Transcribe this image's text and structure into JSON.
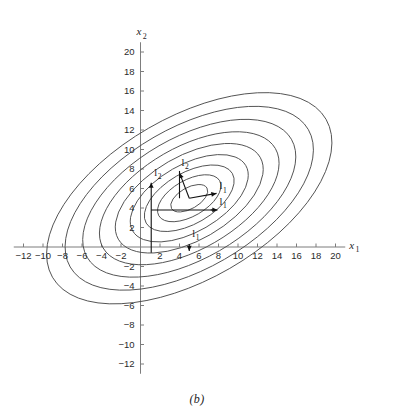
{
  "figure": {
    "caption": "(b)",
    "background_color": "#ffffff",
    "contour_color": "#4a4a4a",
    "axis_color": "#7d7d7d",
    "annotation_color": "#111111"
  },
  "axes": {
    "x": {
      "name": "x",
      "subscript": "1",
      "label": "x₁",
      "min": -13,
      "max": 21,
      "tick_step": 2,
      "ticks": [
        -12,
        -10,
        -8,
        -6,
        -4,
        -2,
        2,
        4,
        6,
        8,
        10,
        12,
        14,
        16,
        18,
        20
      ],
      "tick_labels": [
        "−12",
        "−10",
        "−8",
        "−6",
        "−4",
        "−2",
        "2",
        "4",
        "6",
        "8",
        "10",
        "12",
        "14",
        "16",
        "18",
        "20"
      ]
    },
    "y": {
      "name": "x",
      "subscript": "2",
      "label": "x₂",
      "min": -13,
      "max": 21,
      "tick_step": 2,
      "ticks": [
        -12,
        -10,
        -8,
        -6,
        -4,
        -2,
        2,
        4,
        6,
        8,
        10,
        12,
        14,
        16,
        18,
        20
      ],
      "tick_labels": [
        "−12",
        "−10",
        "−8",
        "−6",
        "−4",
        "−2",
        "2",
        "4",
        "6",
        "8",
        "10",
        "12",
        "14",
        "16",
        "18",
        "20"
      ]
    }
  },
  "annotations": {
    "vectors": [
      {
        "id": "l1-major",
        "label": "l",
        "subscript": "1",
        "display": "l₁",
        "description": "eigenvector along major axis",
        "from": [
          5.0,
          5.0
        ],
        "to": [
          7.8,
          5.5
        ],
        "label_at": [
          8.1,
          5.9
        ]
      },
      {
        "id": "l2-minor",
        "label": "l",
        "subscript": "2",
        "display": "l₂",
        "description": "eigenvector along minor axis",
        "from": [
          5.0,
          5.0
        ],
        "to": [
          4.0,
          7.6
        ],
        "label_at": [
          4.2,
          8.3
        ]
      },
      {
        "id": "l1-projection-x",
        "label": "l",
        "subscript": "1",
        "display": "l₁",
        "description": "projection of l1 onto x1 axis",
        "from": [
          5.0,
          0.3
        ],
        "to": [
          5.0,
          -0.4
        ],
        "label_at": [
          5.3,
          1.0
        ]
      },
      {
        "id": "l1-projection-y",
        "label": "l",
        "subscript": "1",
        "display": "l₁",
        "description": "horizontal component marker for l1",
        "from": [
          7.2,
          3.8
        ],
        "to": [
          7.9,
          3.8
        ],
        "label_at": [
          8.1,
          4.3
        ]
      },
      {
        "id": "l2-projection-y",
        "label": "l",
        "subscript": "2",
        "display": "l₂",
        "description": "projection of l2 onto x2 axis",
        "from": [
          1.1,
          4.0
        ],
        "to": [
          1.1,
          6.6
        ],
        "label_at": [
          1.4,
          7.3
        ]
      }
    ],
    "brackets": [
      {
        "id": "l1-horizontal-rule",
        "from": [
          1.1,
          3.8
        ],
        "to": [
          7.7,
          3.8
        ]
      },
      {
        "id": "l2-vertical-rule",
        "from": [
          1.1,
          -0.6
        ],
        "to": [
          1.1,
          4.0
        ]
      },
      {
        "id": "l2-top-rule",
        "from": [
          4.0,
          5.0
        ],
        "to": [
          4.0,
          7.8
        ]
      }
    ]
  },
  "chart_data": {
    "type": "line",
    "title": "",
    "subtitle": "",
    "xlabel": "x₁",
    "ylabel": "x₂",
    "xlim": [
      -13,
      21
    ],
    "ylim": [
      -13,
      21
    ],
    "grid": false,
    "legend": "none",
    "center": [
      5.0,
      5.0
    ],
    "rotation_deg": 30,
    "axis_ratio": 1.95,
    "contour_count": 9,
    "contours": [
      {
        "level": 1,
        "semi_major": 2.1,
        "semi_minor": 1.08
      },
      {
        "level": 2,
        "semi_major": 3.6,
        "semi_minor": 1.85
      },
      {
        "level": 3,
        "semi_major": 5.1,
        "semi_minor": 2.62
      },
      {
        "level": 4,
        "semi_major": 6.7,
        "semi_minor": 3.44
      },
      {
        "level": 5,
        "semi_major": 8.4,
        "semi_minor": 4.31
      },
      {
        "level": 6,
        "semi_major": 10.2,
        "semi_minor": 5.23
      },
      {
        "level": 7,
        "semi_major": 12.1,
        "semi_minor": 6.21
      },
      {
        "level": 8,
        "semi_major": 14.1,
        "semi_minor": 7.23
      },
      {
        "level": 9,
        "semi_major": 16.2,
        "semi_minor": 8.31
      }
    ],
    "series": [
      {
        "name": "contour-1",
        "values": [
          2.1,
          1.08
        ]
      },
      {
        "name": "contour-2",
        "values": [
          3.6,
          1.85
        ]
      },
      {
        "name": "contour-3",
        "values": [
          5.1,
          2.62
        ]
      },
      {
        "name": "contour-4",
        "values": [
          6.7,
          3.44
        ]
      },
      {
        "name": "contour-5",
        "values": [
          8.4,
          4.31
        ]
      },
      {
        "name": "contour-6",
        "values": [
          10.2,
          5.23
        ]
      },
      {
        "name": "contour-7",
        "values": [
          12.1,
          6.21
        ]
      },
      {
        "name": "contour-8",
        "values": [
          14.1,
          7.23
        ]
      },
      {
        "name": "contour-9",
        "values": [
          16.2,
          8.31
        ]
      }
    ]
  }
}
